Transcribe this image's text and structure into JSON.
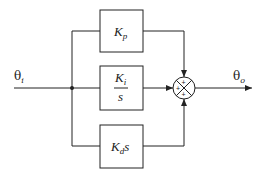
{
  "diagram": {
    "type": "block-diagram",
    "input": {
      "label": "θ",
      "subscript": "i"
    },
    "output": {
      "label": "θ",
      "subscript": "o"
    },
    "blocks": [
      {
        "id": "proportional",
        "main": "K",
        "sub": "p",
        "suffix": ""
      },
      {
        "id": "integral",
        "numerator_main": "K",
        "numerator_sub": "i",
        "denominator": "s"
      },
      {
        "id": "derivative",
        "main": "K",
        "sub": "d",
        "suffix": "s"
      }
    ],
    "summing_junction": {
      "signs": [
        "+",
        "+",
        "+"
      ]
    },
    "colors": {
      "line": "#222222",
      "background": "#ffffff"
    }
  }
}
